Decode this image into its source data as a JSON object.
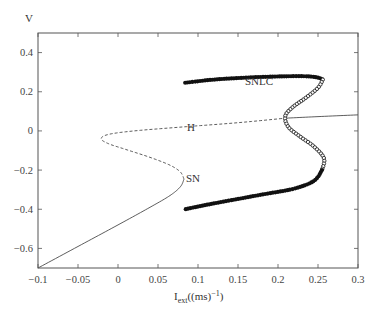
{
  "chart_data": {
    "type": "line",
    "title": "",
    "xlabel": "I_ext((ms)^-1)",
    "xlabel_parts": {
      "base": "I",
      "sub": "ext",
      "rest": "((ms)",
      "sup": "-1",
      "close": ")"
    },
    "ylabel": "V",
    "xlim": [
      -0.1,
      0.3
    ],
    "ylim": [
      -0.7,
      0.5
    ],
    "x_ticks": [
      -0.1,
      -0.05,
      0,
      0.05,
      0.1,
      0.15,
      0.2,
      0.25,
      0.3
    ],
    "x_tick_labels": [
      "-0.1",
      "-0.05",
      "0",
      "0.05",
      "0.1",
      "0.15",
      "0.2",
      "0.25",
      "0.3"
    ],
    "y_ticks": [
      -0.6,
      -0.4,
      -0.2,
      0,
      0.2,
      0.4
    ],
    "y_tick_labels": [
      "-0.6",
      "-0.4",
      "-0.2",
      "0",
      "0.2",
      "0.4"
    ],
    "grid": false,
    "legend": null,
    "series": [
      {
        "name": "stable equilibrium (lower)",
        "style": "solid-thin",
        "points": [
          [
            -0.1,
            -0.7
          ],
          [
            -0.05,
            -0.59
          ],
          [
            0.0,
            -0.48
          ],
          [
            0.04,
            -0.39
          ],
          [
            0.065,
            -0.33
          ],
          [
            0.078,
            -0.285
          ],
          [
            0.0825,
            -0.246
          ]
        ]
      },
      {
        "name": "unstable equilibrium (middle)",
        "style": "dashed-thin",
        "points": [
          [
            0.0825,
            -0.246
          ],
          [
            0.078,
            -0.21
          ],
          [
            0.065,
            -0.175
          ],
          [
            0.04,
            -0.135
          ],
          [
            0.01,
            -0.095
          ],
          [
            -0.012,
            -0.065
          ],
          [
            -0.021,
            -0.04
          ],
          [
            -0.012,
            -0.018
          ],
          [
            0.02,
            0.0
          ],
          [
            0.08,
            0.02
          ],
          [
            0.15,
            0.042
          ],
          [
            0.209,
            0.065
          ]
        ]
      },
      {
        "name": "stable equilibrium (upper)",
        "style": "solid-thin",
        "points": [
          [
            0.209,
            0.065
          ],
          [
            0.25,
            0.073
          ],
          [
            0.3,
            0.082
          ]
        ]
      },
      {
        "name": "stable limit cycle max",
        "style": "filled-circles",
        "points": [
          [
            0.084,
            0.246
          ],
          [
            0.12,
            0.262
          ],
          [
            0.16,
            0.272
          ],
          [
            0.2,
            0.278
          ],
          [
            0.235,
            0.279
          ],
          [
            0.25,
            0.272
          ],
          [
            0.256,
            0.262
          ]
        ]
      },
      {
        "name": "unstable limit cycle",
        "style": "open-circles",
        "points": [
          [
            0.256,
            0.262
          ],
          [
            0.25,
            0.22
          ],
          [
            0.235,
            0.17
          ],
          [
            0.218,
            0.12
          ],
          [
            0.209,
            0.075
          ],
          [
            0.213,
            0.02
          ],
          [
            0.228,
            -0.03
          ],
          [
            0.245,
            -0.08
          ],
          [
            0.2575,
            -0.14
          ],
          [
            0.255,
            -0.2
          ]
        ]
      },
      {
        "name": "stable limit cycle min",
        "style": "filled-circles",
        "points": [
          [
            0.255,
            -0.2
          ],
          [
            0.245,
            -0.255
          ],
          [
            0.22,
            -0.295
          ],
          [
            0.18,
            -0.325
          ],
          [
            0.14,
            -0.355
          ],
          [
            0.11,
            -0.378
          ],
          [
            0.084,
            -0.4
          ]
        ]
      }
    ],
    "annotations": [
      {
        "text": "SN",
        "x": 0.084,
        "y": -0.246
      },
      {
        "text": "H",
        "x": 0.195,
        "y": 0.02
      },
      {
        "text": "SNLC",
        "x": 0.259,
        "y": 0.27
      }
    ]
  },
  "labels": {
    "ylabel": "V",
    "sn": "SN",
    "h": "H",
    "snlc": "SNLC",
    "x_base": "I",
    "x_sub": "ext",
    "x_rest": "((ms)",
    "x_sup": "−1",
    "x_close": ")"
  },
  "tick_text": {
    "x": [
      "−0.1",
      "−0.05",
      "0",
      "0.05",
      "0.1",
      "0.15",
      "0.2",
      "0.25",
      "0.3"
    ],
    "y": [
      "−0.6",
      "−0.4",
      "−0.2",
      "0",
      "0.2",
      "0.4"
    ]
  },
  "colors": {
    "axis": "#555555",
    "line": "#333333",
    "marker": "#111111",
    "text": "#333333"
  }
}
